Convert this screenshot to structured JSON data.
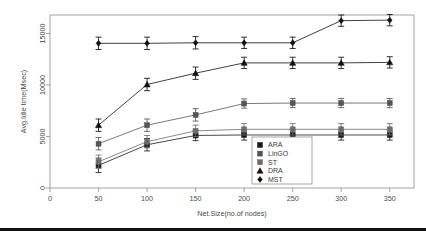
{
  "chart_data": {
    "type": "line",
    "title": "",
    "subtitle": "",
    "xlabel": "Net.Size(no.of nodes)",
    "ylabel": "Avg.Idle time(Msec)",
    "x": [
      50,
      100,
      150,
      200,
      250,
      300,
      350
    ],
    "xlim": [
      0,
      375
    ],
    "ylim": [
      0,
      16800
    ],
    "xticks": [
      0,
      50,
      100,
      150,
      200,
      250,
      300,
      350
    ],
    "xticklabels": [
      "0",
      "50",
      "100",
      "150",
      "200",
      "250",
      "300",
      "350"
    ],
    "yticks": [
      0,
      5000,
      10000,
      15000
    ],
    "yticklabels": [
      "0",
      "5000",
      "10000",
      "15000"
    ],
    "grid": false,
    "legend_position": "bottom-right",
    "error_bars": true,
    "series": [
      {
        "name": "ARA",
        "marker": "square",
        "color": "#1a1a1a",
        "values": [
          2200,
          4200,
          5100,
          5150,
          5150,
          5150,
          5150
        ],
        "errors": [
          700,
          600,
          500,
          500,
          500,
          500,
          500
        ]
      },
      {
        "name": "LinGO",
        "marker": "square",
        "color": "#555555",
        "values": [
          4300,
          6100,
          7100,
          8200,
          8250,
          8250,
          8250
        ],
        "errors": [
          600,
          600,
          600,
          450,
          450,
          450,
          450
        ]
      },
      {
        "name": "ST",
        "marker": "square",
        "color": "#6b6b6b",
        "values": [
          2550,
          4500,
          5550,
          5700,
          5700,
          5700,
          5700
        ],
        "errors": [
          650,
          600,
          550,
          550,
          550,
          550,
          550
        ]
      },
      {
        "name": "DRA",
        "marker": "triangle",
        "color": "#111111",
        "values": [
          6100,
          10050,
          11150,
          12150,
          12150,
          12150,
          12200
        ],
        "errors": [
          600,
          600,
          600,
          550,
          550,
          550,
          550
        ]
      },
      {
        "name": "MST",
        "marker": "diamond",
        "color": "#111111",
        "values": [
          14050,
          14050,
          14100,
          14100,
          14100,
          16250,
          16300
        ],
        "errors": [
          600,
          600,
          600,
          550,
          550,
          550,
          550
        ]
      }
    ],
    "legend_entries": [
      "ARA",
      "LinGO",
      "ST",
      "DRA",
      "MST"
    ]
  },
  "legend": {
    "items": [
      {
        "label": "ARA"
      },
      {
        "label": "LinGO"
      },
      {
        "label": "ST"
      },
      {
        "label": "DRA"
      },
      {
        "label": "MST"
      }
    ]
  },
  "axes": {
    "x_title": "Net.Size(no.of nodes)",
    "y_title": "Avg.Idle time(Msec)",
    "x_tick_labels": [
      "0",
      "50",
      "100",
      "150",
      "200",
      "250",
      "300",
      "350"
    ],
    "y_tick_labels": [
      "0",
      "5000",
      "10000",
      "15000"
    ]
  },
  "colors": {
    "frame": "#9a9a9a",
    "text": "#4a4a4a",
    "rule": "#111111"
  }
}
